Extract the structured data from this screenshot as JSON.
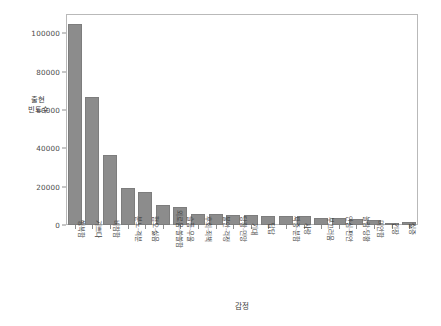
{
  "chart_data": {
    "type": "bar",
    "title": "",
    "subtitle": "",
    "xlabel": "감정",
    "ylabel": "출현\n빈도수",
    "ylabel_line1": "출현",
    "ylabel_line2": "빈도수",
    "categories": [
      "행복함",
      "기쁘다",
      "비참함",
      "분노·격분",
      "혐오·싫음",
      "외로움·쓸쓸함",
      "슬픔·우울",
      "후회·죄책",
      "불안·걱정",
      "당황·민망",
      "기대",
      "답답",
      "짜증·분함",
      "사랑",
      "부끄러움",
      "안심·편안",
      "놀람·당황",
      "미안함",
      "긴장",
      "싫증"
    ],
    "values": [
      105000,
      66500,
      36500,
      19500,
      17000,
      10500,
      9200,
      5900,
      5900,
      5400,
      5400,
      4700,
      4600,
      4600,
      3800,
      3500,
      3300,
      2700,
      1200,
      1500
    ],
    "ylim": [
      0,
      110000
    ],
    "yticks": [
      0,
      20000,
      40000,
      60000,
      80000,
      100000
    ],
    "ytick_labels": [
      "0",
      "20000",
      "40000",
      "60000",
      "80000",
      "100000"
    ],
    "grid": false,
    "legend": false,
    "bar_color": "#8c8c8c",
    "bar_edge_color": "#7d7d7d",
    "frame_color": "#b9b9b9",
    "text_color": "#3f3f3f"
  }
}
